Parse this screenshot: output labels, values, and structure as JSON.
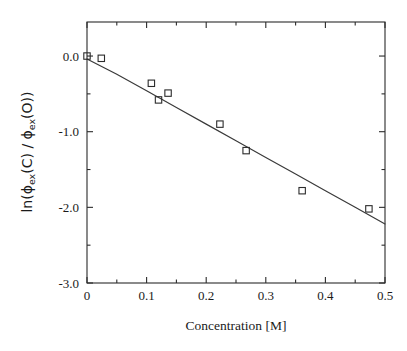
{
  "chart_data": {
    "type": "scatter",
    "title": "",
    "xlabel": "Concentration  [M]",
    "ylabel": "ln(ϕex(C) / ϕex(O))",
    "ylabel_parts": {
      "prefix": "ln(",
      "phi1": "ϕ",
      "sub1": "ex",
      "arg1": "(C)",
      "separator": " / ",
      "phi2": "ϕ",
      "sub2": "ex",
      "arg2": "(O)",
      "suffix": ")"
    },
    "xlim": [
      0,
      0.5
    ],
    "ylim": [
      -3.0,
      0.45
    ],
    "xticks": [
      0,
      0.1,
      0.2,
      0.3,
      0.4,
      0.5
    ],
    "xtick_labels": [
      "0",
      "0.1",
      "0.2",
      "0.3",
      "0.4",
      "0.5"
    ],
    "xticks_minor": [
      0.05,
      0.15,
      0.25,
      0.35,
      0.45
    ],
    "yticks": [
      0.0,
      -1.0,
      -2.0,
      -3.0
    ],
    "ytick_labels": [
      "0.0",
      "-1.0",
      "-2.0",
      "-3.0"
    ],
    "yticks_minor": [
      -0.5,
      -1.5,
      -2.5
    ],
    "grid": false,
    "legend": null,
    "marker_style": "open-square",
    "x": [
      0.0,
      0.024,
      0.108,
      0.12,
      0.136,
      0.223,
      0.267,
      0.361,
      0.473
    ],
    "y": [
      0.0,
      -0.03,
      -0.36,
      -0.58,
      -0.49,
      -0.9,
      -1.25,
      -1.78,
      -2.02
    ],
    "points": [
      {
        "x": 0.0,
        "y": 0.0
      },
      {
        "x": 0.024,
        "y": -0.03
      },
      {
        "x": 0.108,
        "y": -0.36
      },
      {
        "x": 0.12,
        "y": -0.58
      },
      {
        "x": 0.136,
        "y": -0.49
      },
      {
        "x": 0.223,
        "y": -0.9
      },
      {
        "x": 0.267,
        "y": -1.25
      },
      {
        "x": 0.361,
        "y": -1.78
      },
      {
        "x": 0.473,
        "y": -2.02
      }
    ],
    "series": [
      {
        "name": "fit",
        "type": "line",
        "description": "least-squares quadratic fit curve",
        "x": [
          0.0,
          0.05,
          0.1,
          0.15,
          0.2,
          0.25,
          0.3,
          0.35,
          0.4,
          0.45,
          0.5
        ],
        "y": [
          -0.04,
          -0.24,
          -0.46,
          -0.68,
          -0.9,
          -1.12,
          -1.34,
          -1.56,
          -1.78,
          -2.0,
          -2.22
        ]
      }
    ]
  }
}
